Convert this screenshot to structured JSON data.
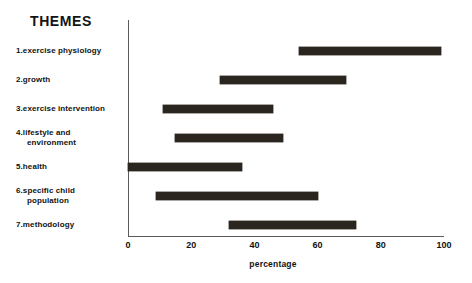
{
  "chart_data": {
    "type": "bar",
    "orientation": "horizontal",
    "subtype": "range-bar",
    "title": "THEMES",
    "xlabel": "percentage",
    "ylabel": "",
    "xlim": [
      0,
      100
    ],
    "xticks": [
      0,
      20,
      40,
      60,
      80,
      100
    ],
    "xticklabels": [
      "0",
      "20",
      "40",
      "60",
      "80",
      "100"
    ],
    "grid": false,
    "legend": false,
    "bar_color": "#2b2520",
    "axis_color": "#5b5b5b",
    "categories": [
      "1.exercise physiology",
      "2.growth",
      "3.exercise intervention",
      "4.lifestyle and environment",
      "5.health",
      "6.specific child population",
      "7.methodology"
    ],
    "category_lines": [
      [
        "1.exercise physiology"
      ],
      [
        "2.growth"
      ],
      [
        "3.exercise intervention"
      ],
      [
        "4.lifestyle and",
        "environment"
      ],
      [
        "5.health"
      ],
      [
        "6.specific child",
        "population"
      ],
      [
        "7.methodology"
      ]
    ],
    "bars": [
      {
        "label": "1.exercise physiology",
        "start": 54,
        "end": 99
      },
      {
        "label": "2.growth",
        "start": 29,
        "end": 69
      },
      {
        "label": "3.exercise intervention",
        "start": 11,
        "end": 46
      },
      {
        "label": "4.lifestyle and environment",
        "start": 15,
        "end": 49
      },
      {
        "label": "5.health",
        "start": 0,
        "end": 36
      },
      {
        "label": "6.specific child population",
        "start": 9,
        "end": 60
      },
      {
        "label": "7.methodology",
        "start": 32,
        "end": 72
      }
    ]
  }
}
